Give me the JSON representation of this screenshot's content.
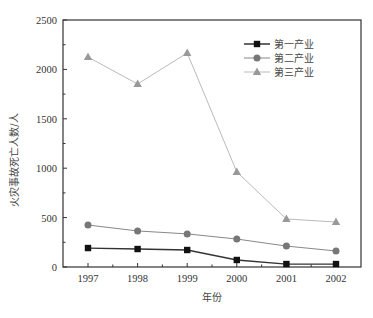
{
  "chart_data": {
    "type": "line",
    "title": "",
    "xlabel": "年份",
    "ylabel": "火灾事故死亡人数/人",
    "categories": [
      "1997",
      "1998",
      "1999",
      "2000",
      "2001",
      "2002"
    ],
    "x": [
      1997,
      1998,
      1999,
      2000,
      2001,
      2002
    ],
    "series": [
      {
        "name": "第一产业",
        "marker": "square",
        "color": "#111111",
        "line_color": "#333333",
        "values": [
          192,
          182,
          172,
          71,
          30,
          30
        ]
      },
      {
        "name": "第二产业",
        "marker": "circle",
        "color": "#777777",
        "line_color": "#888888",
        "values": [
          425,
          365,
          335,
          283,
          212,
          162
        ]
      },
      {
        "name": "第三产业",
        "marker": "triangle",
        "color": "#999999",
        "line_color": "#bbbbbb",
        "values": [
          2125,
          1852,
          2166,
          962,
          486,
          455
        ]
      }
    ],
    "ylim": [
      0,
      2500
    ],
    "yticks": [
      0,
      500,
      1000,
      1500,
      2000,
      2500
    ],
    "xticks": [
      "1997",
      "1998",
      "1999",
      "2000",
      "2001",
      "2002"
    ],
    "grid": false,
    "legend_position": "upper right"
  }
}
